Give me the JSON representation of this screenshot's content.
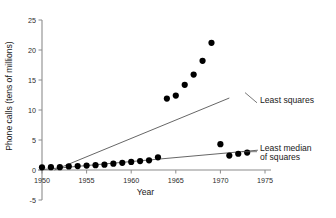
{
  "chart_data": {
    "type": "scatter",
    "title": "",
    "xlabel": "Year",
    "ylabel": "Phone calls (tens of millions)",
    "xlim": [
      1950,
      1975
    ],
    "ylim": [
      -5,
      25
    ],
    "xticks": [
      1950,
      1955,
      1960,
      1965,
      1970,
      1975
    ],
    "xtick_labels": [
      "1950",
      "1955",
      "1960",
      "1965",
      "1970",
      "1975"
    ],
    "yticks": [
      -5,
      0,
      5,
      10,
      15,
      20,
      25
    ],
    "ytick_labels": [
      "-5",
      "0",
      "5",
      "10",
      "15",
      "20",
      "25"
    ],
    "grid": false,
    "legend_position": "right-inline-annotations",
    "series": [
      {
        "name": "Phone calls",
        "type": "scatter",
        "marker": "filled-circle",
        "color": "#000000",
        "x": [
          1950,
          1951,
          1952,
          1953,
          1954,
          1955,
          1956,
          1957,
          1958,
          1959,
          1960,
          1961,
          1962,
          1963,
          1964,
          1965,
          1966,
          1967,
          1968,
          1969,
          1970,
          1971,
          1972,
          1973
        ],
        "y": [
          0.44,
          0.47,
          0.47,
          0.59,
          0.66,
          0.73,
          0.81,
          0.88,
          1.06,
          1.2,
          1.35,
          1.49,
          1.61,
          2.12,
          11.9,
          12.4,
          14.2,
          15.9,
          18.2,
          21.2,
          4.3,
          2.4,
          2.7058,
          2.9
        ]
      },
      {
        "name": "Least squares",
        "type": "line",
        "color": "#555555",
        "x": [
          1951.4,
          1971.0
        ],
        "y": [
          0.0,
          12.0
        ]
      },
      {
        "name": "Least median of squares",
        "type": "line",
        "color": "#555555",
        "x": [
          1950.2,
          1974.2
        ],
        "y": [
          0.1,
          3.3
        ]
      }
    ],
    "annotations": [
      {
        "text": "Least squares",
        "x": 1971.6,
        "y": 11.7
      },
      {
        "text": "Least median",
        "x": 1971.6,
        "y": 3.6
      },
      {
        "text": "of squares",
        "x": 1971.6,
        "y": 2.2
      }
    ]
  }
}
